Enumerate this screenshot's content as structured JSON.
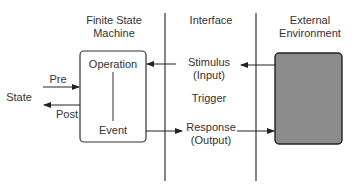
{
  "columns": {
    "fsm": [
      "Finite State",
      "Machine"
    ],
    "interface": "Interface",
    "external": [
      "External",
      "Environment"
    ]
  },
  "fsm_box": {
    "top_label": "Operation",
    "bottom_label": "Event"
  },
  "state_label": "State",
  "pre_label": "Pre",
  "post_label": "Post",
  "interface_items": {
    "stimulus": [
      "Stimulus",
      "(Input)"
    ],
    "trigger": "Trigger",
    "response": [
      "Response",
      "(Output)"
    ]
  },
  "colors": {
    "line": "#333333",
    "environment_fill": "#8c8c8c"
  }
}
